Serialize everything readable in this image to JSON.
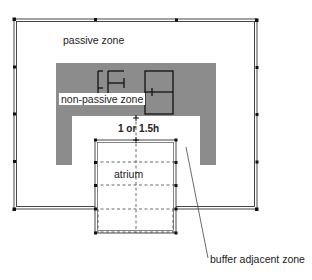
{
  "diagram": {
    "type": "architectural plan diagram",
    "colors": {
      "frame": "#333333",
      "non_passive_fill": "#8c8c8c",
      "background": "#ffffff",
      "text": "#222222"
    },
    "labels": {
      "passive_zone": "passive zone",
      "non_passive_zone": "non-passive zone",
      "dimension": "1 or 1.5h",
      "atrium": "atrium",
      "buffer_adjacent_zone": "buffer adjacent zone"
    }
  }
}
